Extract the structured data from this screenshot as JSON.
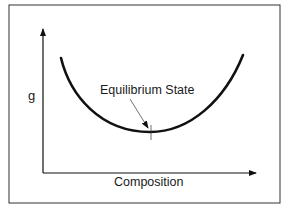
{
  "diagram": {
    "y_axis_label": "g",
    "x_axis_label": "Composition",
    "annotation": "Equilibrium State",
    "curve": {
      "shape": "U-shaped free-energy curve",
      "start": [
        61,
        58
      ],
      "minimum": [
        150,
        132
      ],
      "end": [
        243,
        55
      ]
    },
    "colors": {
      "line": "#111111",
      "frame": "#333333",
      "background": "#ffffff"
    }
  }
}
